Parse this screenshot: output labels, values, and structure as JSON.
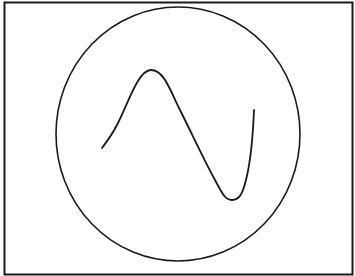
{
  "figure": {
    "elements": [
      "frame",
      "circle",
      "sine-curve"
    ],
    "colors": {
      "background": "#ffffff",
      "stroke": "#1a1a1a"
    }
  }
}
